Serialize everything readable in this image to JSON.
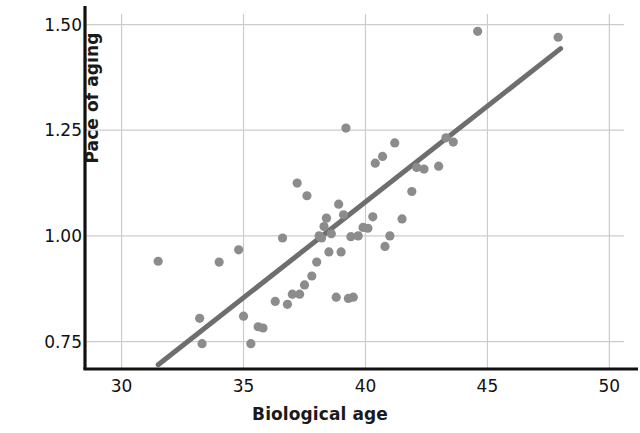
{
  "chart_data": {
    "type": "scatter",
    "title": "",
    "xlabel": "Biological age",
    "ylabel": "Pace of aging",
    "xlim": [
      28.5,
      50.6
    ],
    "ylim": [
      0.685,
      1.525
    ],
    "xticks": [
      30,
      35,
      40,
      45,
      50
    ],
    "xtick_labels": [
      "30",
      "35",
      "40",
      "45",
      "50"
    ],
    "yticks": [
      0.75,
      1.0,
      1.25,
      1.5
    ],
    "ytick_labels": [
      "0.75",
      "1.00",
      "1.25",
      "1.50"
    ],
    "grid": true,
    "legend": "none",
    "point_color": "#8c8c8c",
    "line_color": "#6e6e6e",
    "axis_color": "#111111",
    "grid_color": "#cccccc",
    "trendline": {
      "x": [
        31.5,
        48.0
      ],
      "y": [
        0.695,
        1.443
      ]
    },
    "points": [
      {
        "x": 31.5,
        "y": 0.94
      },
      {
        "x": 33.3,
        "y": 0.745
      },
      {
        "x": 34.0,
        "y": 0.938
      },
      {
        "x": 34.8,
        "y": 0.967
      },
      {
        "x": 33.2,
        "y": 0.805
      },
      {
        "x": 35.0,
        "y": 0.81
      },
      {
        "x": 35.3,
        "y": 0.745
      },
      {
        "x": 35.6,
        "y": 0.785
      },
      {
        "x": 35.8,
        "y": 0.782
      },
      {
        "x": 36.3,
        "y": 0.845
      },
      {
        "x": 36.8,
        "y": 0.838
      },
      {
        "x": 37.0,
        "y": 0.862
      },
      {
        "x": 36.6,
        "y": 0.995
      },
      {
        "x": 37.3,
        "y": 0.862
      },
      {
        "x": 37.5,
        "y": 0.884
      },
      {
        "x": 37.2,
        "y": 1.125
      },
      {
        "x": 37.6,
        "y": 1.095
      },
      {
        "x": 37.8,
        "y": 0.905
      },
      {
        "x": 38.0,
        "y": 0.938
      },
      {
        "x": 38.1,
        "y": 1.0
      },
      {
        "x": 38.2,
        "y": 0.995
      },
      {
        "x": 38.3,
        "y": 1.022
      },
      {
        "x": 38.4,
        "y": 1.042
      },
      {
        "x": 38.5,
        "y": 0.962
      },
      {
        "x": 38.6,
        "y": 1.005
      },
      {
        "x": 38.8,
        "y": 0.855
      },
      {
        "x": 39.0,
        "y": 0.962
      },
      {
        "x": 39.1,
        "y": 1.05
      },
      {
        "x": 38.9,
        "y": 1.075
      },
      {
        "x": 39.3,
        "y": 0.852
      },
      {
        "x": 39.5,
        "y": 0.855
      },
      {
        "x": 39.2,
        "y": 1.255
      },
      {
        "x": 39.4,
        "y": 0.998
      },
      {
        "x": 39.7,
        "y": 1.0
      },
      {
        "x": 39.9,
        "y": 1.02
      },
      {
        "x": 40.1,
        "y": 1.018
      },
      {
        "x": 40.3,
        "y": 1.045
      },
      {
        "x": 40.4,
        "y": 1.172
      },
      {
        "x": 40.7,
        "y": 1.188
      },
      {
        "x": 40.8,
        "y": 0.975
      },
      {
        "x": 41.2,
        "y": 1.22
      },
      {
        "x": 41.0,
        "y": 1.0
      },
      {
        "x": 41.5,
        "y": 1.04
      },
      {
        "x": 41.9,
        "y": 1.105
      },
      {
        "x": 42.1,
        "y": 1.162
      },
      {
        "x": 42.4,
        "y": 1.158
      },
      {
        "x": 43.0,
        "y": 1.165
      },
      {
        "x": 43.3,
        "y": 1.232
      },
      {
        "x": 43.6,
        "y": 1.222
      },
      {
        "x": 44.6,
        "y": 1.484
      },
      {
        "x": 47.9,
        "y": 1.47
      }
    ]
  }
}
